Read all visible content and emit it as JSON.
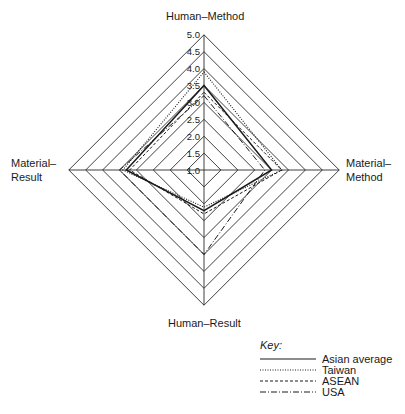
{
  "chart_data": {
    "type": "radar",
    "title": "",
    "axes": [
      "Human–Method",
      "Material–Method",
      "Human–Result",
      "Material–Result"
    ],
    "scale": {
      "min": 1.0,
      "max": 5.0,
      "step": 0.5,
      "ticks": [
        "1.0",
        "1.5",
        "2.0",
        "2.5",
        "3.0",
        "3.5",
        "4.0",
        "4.5",
        "5.0"
      ]
    },
    "grid": true,
    "legend_position": "bottom-right",
    "legend_title": "Key:",
    "series": [
      {
        "name": "Asian average",
        "style": "solid",
        "values": [
          3.5,
          3.0,
          2.2,
          3.3
        ]
      },
      {
        "name": "Taiwan",
        "style": "dotted",
        "values": [
          3.9,
          3.3,
          2.1,
          3.4
        ]
      },
      {
        "name": "ASEAN",
        "style": "dashed",
        "values": [
          3.3,
          3.3,
          2.3,
          3.2
        ]
      },
      {
        "name": "USA",
        "style": "dash-dot",
        "values": [
          3.2,
          2.8,
          3.5,
          3.5
        ]
      }
    ]
  },
  "labels": {
    "top": "Human–Method",
    "right_line1": "Material–",
    "right_line2": "Method",
    "bottom": "Human–Result",
    "left_line1": "Material–",
    "left_line2": "Result"
  },
  "legend": {
    "title": "Key:",
    "items": [
      "Asian average",
      "Taiwan",
      "ASEAN",
      "USA"
    ]
  },
  "colors": {
    "line": "#1a1a1a",
    "grid": "#2a2a2a",
    "background": "#ffffff"
  }
}
